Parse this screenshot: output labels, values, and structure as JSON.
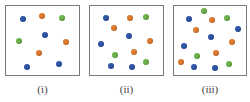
{
  "colors": {
    "blue": "#2f55a8",
    "orange": "#e07a2e",
    "green": "#6cb14a",
    "border": "#7a7a7a"
  },
  "panels": [
    {
      "label": "(i)",
      "box": {
        "x": 5,
        "y": 5,
        "w": 75,
        "h": 71
      },
      "particles": [
        {
          "color": "blue",
          "x": 23,
          "y": 19
        },
        {
          "color": "orange",
          "x": 42,
          "y": 16
        },
        {
          "color": "green",
          "x": 62,
          "y": 18
        },
        {
          "color": "blue",
          "x": 45,
          "y": 35
        },
        {
          "color": "green",
          "x": 19,
          "y": 41
        },
        {
          "color": "orange",
          "x": 66,
          "y": 42
        },
        {
          "color": "orange",
          "x": 39,
          "y": 53
        },
        {
          "color": "blue",
          "x": 27,
          "y": 67
        },
        {
          "color": "blue",
          "x": 59,
          "y": 64
        }
      ]
    },
    {
      "label": "(ii)",
      "box": {
        "x": 89,
        "y": 5,
        "w": 75,
        "h": 71
      },
      "particles": [
        {
          "color": "blue",
          "x": 106,
          "y": 18
        },
        {
          "color": "orange",
          "x": 130,
          "y": 18
        },
        {
          "color": "green",
          "x": 146,
          "y": 17
        },
        {
          "color": "orange",
          "x": 114,
          "y": 28
        },
        {
          "color": "blue",
          "x": 129,
          "y": 36
        },
        {
          "color": "orange",
          "x": 150,
          "y": 41
        },
        {
          "color": "blue",
          "x": 101,
          "y": 44
        },
        {
          "color": "green",
          "x": 115,
          "y": 55
        },
        {
          "color": "orange",
          "x": 134,
          "y": 52
        },
        {
          "color": "green",
          "x": 146,
          "y": 62
        },
        {
          "color": "blue",
          "x": 111,
          "y": 66
        },
        {
          "color": "blue",
          "x": 132,
          "y": 67
        }
      ]
    },
    {
      "label": "(iii)",
      "box": {
        "x": 173,
        "y": 5,
        "w": 74,
        "h": 71
      },
      "particles": [
        {
          "color": "green",
          "x": 204,
          "y": 11
        },
        {
          "color": "blue",
          "x": 189,
          "y": 19
        },
        {
          "color": "orange",
          "x": 212,
          "y": 20
        },
        {
          "color": "green",
          "x": 227,
          "y": 18
        },
        {
          "color": "orange",
          "x": 196,
          "y": 30
        },
        {
          "color": "blue",
          "x": 238,
          "y": 29
        },
        {
          "color": "blue",
          "x": 211,
          "y": 37
        },
        {
          "color": "orange",
          "x": 232,
          "y": 42
        },
        {
          "color": "blue",
          "x": 184,
          "y": 46
        },
        {
          "color": "orange",
          "x": 216,
          "y": 53
        },
        {
          "color": "green",
          "x": 197,
          "y": 56
        },
        {
          "color": "orange",
          "x": 181,
          "y": 62
        },
        {
          "color": "blue",
          "x": 194,
          "y": 67
        },
        {
          "color": "green",
          "x": 229,
          "y": 64
        },
        {
          "color": "blue",
          "x": 215,
          "y": 68
        }
      ]
    }
  ]
}
